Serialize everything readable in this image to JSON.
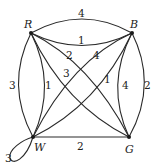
{
  "graph": {
    "vertices": [
      {
        "id": "R",
        "label": "R"
      },
      {
        "id": "B",
        "label": "B"
      },
      {
        "id": "W",
        "label": "W"
      },
      {
        "id": "G",
        "label": "G"
      }
    ],
    "edges": [
      {
        "from": "R",
        "to": "B",
        "weight": "4",
        "style": "outer-curve"
      },
      {
        "from": "R",
        "to": "B",
        "weight": "1",
        "style": "inner-curve"
      },
      {
        "from": "B",
        "to": "G",
        "weight": "2",
        "style": "outer-curve"
      },
      {
        "from": "B",
        "to": "G",
        "weight": "4",
        "style": "inner-curve"
      },
      {
        "from": "R",
        "to": "W",
        "weight": "3",
        "style": "outer-curve"
      },
      {
        "from": "R",
        "to": "W",
        "weight": "1",
        "style": "inner-curve"
      },
      {
        "from": "W",
        "to": "G",
        "weight": "2",
        "style": "straight"
      },
      {
        "from": "R",
        "to": "G",
        "weight": "2",
        "style": "diagonal"
      },
      {
        "from": "R",
        "to": "G",
        "weight": "3",
        "style": "diagonal"
      },
      {
        "from": "B",
        "to": "W",
        "weight": "4",
        "style": "diagonal"
      },
      {
        "from": "B",
        "to": "W",
        "weight": "1",
        "style": "diagonal"
      },
      {
        "from": "W",
        "to": "W",
        "weight": "3",
        "style": "loop"
      }
    ]
  }
}
